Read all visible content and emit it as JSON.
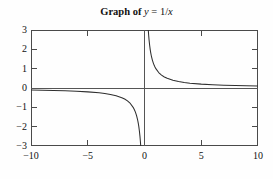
{
  "chart_data": {
    "type": "line",
    "title_parts": {
      "prefix": "Graph of",
      "var_y": "y",
      "equals": "=",
      "expr_num": "1/",
      "expr_var": "x"
    },
    "function": "y = 1/x",
    "xlabel": "",
    "ylabel": "",
    "xlim": [
      -10,
      10
    ],
    "ylim": [
      -3,
      3
    ],
    "grid": false,
    "legend": null,
    "xticks": [
      -10,
      -5,
      0,
      5,
      10
    ],
    "xtick_labels": [
      "−10",
      "−5",
      "0",
      "5",
      "10"
    ],
    "yticks": [
      -3,
      -2,
      -1,
      0,
      1,
      2,
      3
    ],
    "ytick_labels": [
      "3",
      "2",
      "1",
      "0",
      "−1",
      "−2",
      "−3"
    ],
    "tick_direction": "in",
    "axes_drawn": [
      "x-axis at y=0",
      "y-axis at x=0"
    ],
    "asymptotes": {
      "vertical": 0,
      "horizontal": 0
    },
    "branches": [
      {
        "name": "negative-branch",
        "domain": [
          -10,
          -0.3333
        ],
        "points": [
          [
            -10,
            -0.1
          ],
          [
            -9,
            -0.111
          ],
          [
            -8,
            -0.125
          ],
          [
            -7,
            -0.143
          ],
          [
            -6,
            -0.167
          ],
          [
            -5,
            -0.2
          ],
          [
            -4,
            -0.25
          ],
          [
            -3.5,
            -0.286
          ],
          [
            -3,
            -0.333
          ],
          [
            -2.5,
            -0.4
          ],
          [
            -2,
            -0.5
          ],
          [
            -1.75,
            -0.571
          ],
          [
            -1.5,
            -0.667
          ],
          [
            -1.25,
            -0.8
          ],
          [
            -1,
            -1
          ],
          [
            -0.9,
            -1.111
          ],
          [
            -0.8,
            -1.25
          ],
          [
            -0.7,
            -1.429
          ],
          [
            -0.6,
            -1.667
          ],
          [
            -0.55,
            -1.818
          ],
          [
            -0.5,
            -2
          ],
          [
            -0.45,
            -2.222
          ],
          [
            -0.4,
            -2.5
          ],
          [
            -0.3667,
            -2.727
          ],
          [
            -0.3333,
            -3
          ]
        ]
      },
      {
        "name": "positive-branch",
        "domain": [
          0.3333,
          10
        ],
        "points": [
          [
            0.3333,
            3
          ],
          [
            0.3667,
            2.727
          ],
          [
            0.4,
            2.5
          ],
          [
            0.45,
            2.222
          ],
          [
            0.5,
            2
          ],
          [
            0.55,
            1.818
          ],
          [
            0.6,
            1.667
          ],
          [
            0.7,
            1.429
          ],
          [
            0.8,
            1.25
          ],
          [
            0.9,
            1.111
          ],
          [
            1,
            1
          ],
          [
            1.25,
            0.8
          ],
          [
            1.5,
            0.667
          ],
          [
            1.75,
            0.571
          ],
          [
            2,
            0.5
          ],
          [
            2.5,
            0.4
          ],
          [
            3,
            0.333
          ],
          [
            3.5,
            0.286
          ],
          [
            4,
            0.25
          ],
          [
            5,
            0.2
          ],
          [
            6,
            0.167
          ],
          [
            7,
            0.143
          ],
          [
            8,
            0.125
          ],
          [
            9,
            0.111
          ],
          [
            10,
            0.1
          ]
        ]
      }
    ],
    "colors": {
      "curve": "#2f2f2f",
      "frame": "#4a4a4a",
      "axis": "#555555",
      "text": "#111111",
      "background": "#fefefe"
    }
  }
}
